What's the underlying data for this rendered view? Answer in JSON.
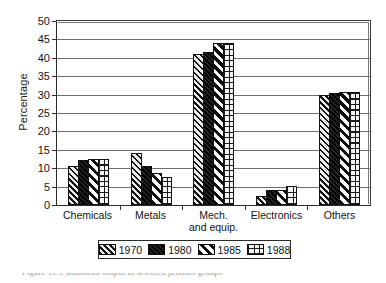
{
  "chart_data": {
    "type": "bar",
    "title": "",
    "xlabel": "",
    "ylabel": "Percentage",
    "ylim": [
      0,
      50
    ],
    "ytick_step": 5,
    "yticks": [
      "0",
      "5",
      "10",
      "15",
      "20",
      "25",
      "30",
      "35",
      "40",
      "45",
      "50"
    ],
    "grid": true,
    "legend_position": "bottom",
    "categories": [
      "Chemicals",
      "Metals",
      "Mech. and equip.",
      "Electronics",
      "Others"
    ],
    "category_labels": [
      {
        "line1": "Chemicals",
        "line2": ""
      },
      {
        "line1": "Metals",
        "line2": ""
      },
      {
        "line1": "Mech.",
        "line2": "and equip."
      },
      {
        "line1": "Electronics",
        "line2": ""
      },
      {
        "line1": "Others",
        "line2": ""
      }
    ],
    "series": [
      {
        "name": "1970",
        "pattern": "diagonal-hatch",
        "values": [
          10.5,
          14.0,
          40.5,
          2.5,
          29.5
        ]
      },
      {
        "name": "1980",
        "pattern": "solid-black",
        "values": [
          12.0,
          10.5,
          41.0,
          4.0,
          30.0
        ]
      },
      {
        "name": "1985",
        "pattern": "wide-diagonal-stripe",
        "values": [
          12.5,
          8.5,
          43.5,
          4.0,
          30.5
        ]
      },
      {
        "name": "1988",
        "pattern": "grid-crosshatch",
        "values": [
          12.5,
          7.5,
          43.5,
          5.0,
          30.5
        ]
      }
    ]
  },
  "legend": {
    "items": [
      {
        "label": "1970",
        "pattern": "diagonal-hatch"
      },
      {
        "label": "1980",
        "pattern": "solid-black"
      },
      {
        "label": "1985",
        "pattern": "wide-diagonal-stripe"
      },
      {
        "label": "1988",
        "pattern": "grid-crosshatch"
      }
    ]
  },
  "caption": {
    "text": "Figure 11.1   Industrial output in selected product groups"
  },
  "colors": {
    "axis": "#2a2a2a",
    "grid": "#6e6e6e",
    "ink": "#111111",
    "background": "#ffffff"
  }
}
